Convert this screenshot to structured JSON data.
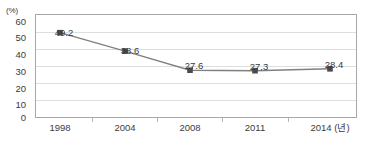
{
  "chart_data": {
    "type": "line",
    "title": "",
    "xlabel": "2014 (년)",
    "ylabel": "(%)",
    "categories": [
      "1998",
      "2004",
      "2008",
      "2011",
      "2014 (년)"
    ],
    "values": [
      49.2,
      38.6,
      27.6,
      27.3,
      28.4
    ],
    "data_labels": [
      "49.2",
      "38.6",
      "27.6",
      "27.3",
      "28.4"
    ],
    "ylim": [
      0,
      60
    ],
    "ytick_labels": [
      "0",
      "10",
      "20",
      "30",
      "40",
      "50",
      "60"
    ],
    "ytick_values": [
      0,
      10,
      20,
      30,
      40,
      50,
      60
    ],
    "grid": "horizontal",
    "legend": "none",
    "series": [
      {
        "name": "",
        "values": [
          49.2,
          38.6,
          27.6,
          27.3,
          28.4
        ],
        "line_color": "#808080",
        "marker_color": "#4a4a4a",
        "marker": "square"
      }
    ],
    "colors": {
      "line": "#808080",
      "marker": "#4a4a4a",
      "grid": "#dedede",
      "frame": "#a8a8a8",
      "text": "#3b3b3b",
      "background": "#ffffff"
    }
  }
}
